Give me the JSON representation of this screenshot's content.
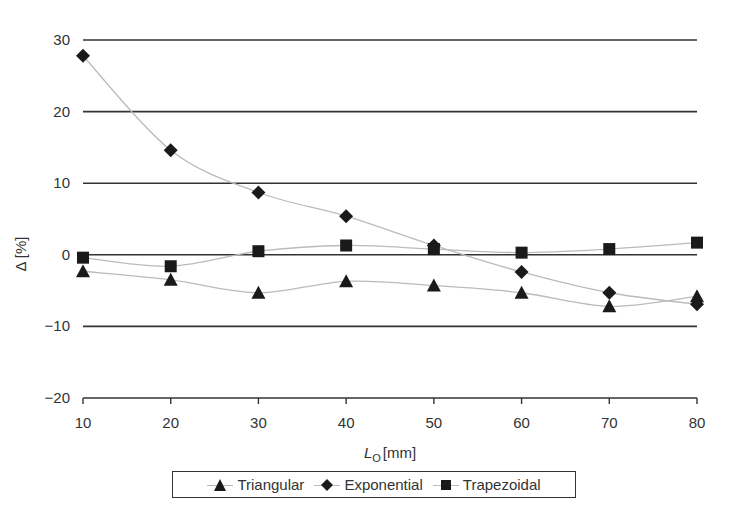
{
  "chart_data": {
    "type": "line",
    "title": "",
    "xlabel": "L_O [mm]",
    "xlabel_main": "L",
    "xlabel_sub": "O",
    "xlabel_unit": "[mm]",
    "ylabel": "Δ [%]",
    "x": [
      10,
      20,
      30,
      40,
      50,
      60,
      70,
      80
    ],
    "xlim": [
      10,
      80
    ],
    "ylim": [
      -20,
      30
    ],
    "xticks": [
      "10",
      "20",
      "30",
      "40",
      "50",
      "60",
      "70",
      "80"
    ],
    "yticks": [
      "30",
      "20",
      "10",
      "0",
      "−10",
      "−20"
    ],
    "ytick_values": [
      30,
      20,
      10,
      0,
      -10,
      -20
    ],
    "grid": "horizontal",
    "legend_position": "bottom",
    "series": [
      {
        "name": "Triangular",
        "marker": "triangle",
        "values": [
          -2.3,
          -3.5,
          -5.3,
          -3.7,
          -4.3,
          -5.3,
          -7.2,
          -5.8
        ]
      },
      {
        "name": "Exponential",
        "marker": "diamond",
        "values": [
          27.8,
          14.6,
          8.7,
          5.4,
          1.3,
          -2.4,
          -5.3,
          -6.9
        ]
      },
      {
        "name": "Trapezoidal",
        "marker": "square",
        "values": [
          -0.4,
          -1.6,
          0.5,
          1.3,
          0.8,
          0.3,
          0.8,
          1.7
        ]
      }
    ],
    "colors": {
      "marker": "#1a1a1a",
      "line": "#bbbbbb",
      "grid": "#333333"
    }
  },
  "legend": {
    "items": [
      "Triangular",
      "Exponential",
      "Trapezoidal"
    ]
  }
}
